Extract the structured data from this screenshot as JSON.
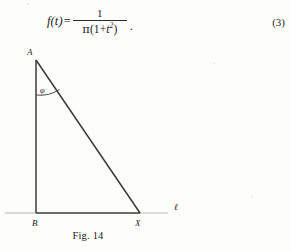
{
  "equation": {
    "lhs": "f(t)",
    "equals": "=",
    "numerator": "1",
    "denominator_pi": "π",
    "denominator_open": "(1",
    "denominator_plus": "+",
    "denominator_var": "t",
    "denominator_exp": "2",
    "denominator_close": ")",
    "trailing_punctuation": ".",
    "number": "(3)",
    "plain_text": "f(t) = 1 / (π(1 + t²))"
  },
  "figure": {
    "caption": "Fig. 14",
    "labels": {
      "apex": "A",
      "base_vertex": "B",
      "point_on_line": "X",
      "line": "ℓ",
      "angle": "φ"
    },
    "geometry": {
      "apex_point": "A",
      "right_angle_vertex": "B",
      "variable_point": "X",
      "baseline_name": "ℓ",
      "angle_at_apex": "φ",
      "description": "Right triangle ABX with vertical leg AB, horizontal baseline through B and X, hypotenuse AX, angle φ between AB and AX at apex A"
    },
    "colors": {
      "ink": "#2a2a2a",
      "light_ink": "#9a9a9a",
      "paper": "#fdfdfc"
    }
  }
}
